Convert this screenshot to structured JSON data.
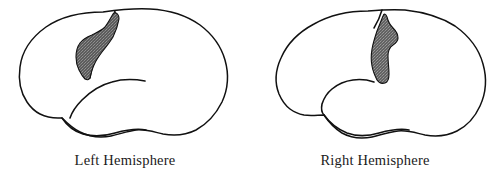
{
  "figure": {
    "background_color": "#ffffff",
    "outline_color": "#111111",
    "lesion_fill_color": "#5c5c5c",
    "lesion_speckle_color": "#8d8d8d",
    "lesion_outline_color": "#111111",
    "label_color": "#1a1a1a"
  },
  "panels": [
    {
      "id": "left-hemisphere",
      "label": "Left Hemisphere",
      "brain_view": "lateral",
      "lesion": {
        "name": "shaded-lesion-region",
        "description": "large shaded patch",
        "location": "superior parietal / postcentral region",
        "shading": "dark gray stipple"
      }
    },
    {
      "id": "right-hemisphere",
      "label": "Right Hemisphere",
      "brain_view": "lateral",
      "lesion": {
        "name": "shaded-lesion-region",
        "description": "narrow elongated shaded strip",
        "location": "central sulcus / precentral region",
        "shading": "dark gray stipple"
      }
    }
  ]
}
